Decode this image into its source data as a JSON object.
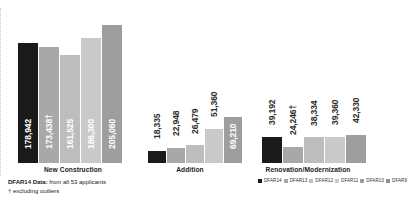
{
  "chart_data": {
    "type": "bar",
    "title": "",
    "xlabel": "",
    "ylabel": "",
    "ylim": [
      0,
      210000
    ],
    "grid": false,
    "legend_position": "bottom-right",
    "categories": [
      "New Construction",
      "Addition",
      "Renovation/Modernization"
    ],
    "series": [
      {
        "name": "DFAR14",
        "color": "#1a1a1a",
        "values": [
          178942,
          18335,
          39192
        ],
        "labels": [
          "178,942",
          "18,335",
          "39,192"
        ]
      },
      {
        "name": "DFAR13",
        "color": "#a8a8a8",
        "values": [
          173438,
          22948,
          24246
        ],
        "labels": [
          "173,438†",
          "22,948",
          "24,246†"
        ]
      },
      {
        "name": "DFAR12",
        "color": "#bdbdbd",
        "values": [
          161525,
          26479,
          38334
        ],
        "labels": [
          "161,525",
          "26,479",
          "38,334"
        ]
      },
      {
        "name": "DFAR11",
        "color": "#c9c9c9",
        "values": [
          186300,
          51360,
          39360
        ],
        "labels": [
          "186,300",
          "51,360",
          "39,360"
        ]
      },
      {
        "name": "DFAR10",
        "color": "#9e9e9e",
        "values": [
          205060,
          69210,
          42330
        ],
        "labels": [
          "205,060",
          "69,210",
          "42,330"
        ]
      }
    ],
    "annotations": {
      "footnote_bold": "DFAR14 Data:",
      "footnote_rest": " from all 53 applicants",
      "footnote_line2": "† excluding outliers"
    }
  },
  "legend": {
    "entries": [
      {
        "label": "DFAR14",
        "color": "#1a1a1a"
      },
      {
        "label": "DFAR13",
        "color": "#a8a8a8"
      },
      {
        "label": "DFAR12",
        "color": "#bdbdbd"
      },
      {
        "label": "DFAR11",
        "color": "#c9c9c9"
      },
      {
        "label": "DFAR10",
        "color": "#9e9e9e"
      },
      {
        "label": "DFAR9",
        "color": "#8f8f8f"
      }
    ]
  },
  "layout": {
    "groups": [
      {
        "left": 18,
        "bar_width": 20,
        "cat_left": 8,
        "cat_width": 130
      },
      {
        "left": 148,
        "bar_width": 18,
        "cat_left": 140,
        "cat_width": 100
      },
      {
        "left": 262,
        "bar_width": 20,
        "cat_left": 248,
        "cat_width": 120
      }
    ],
    "divider_x": 243,
    "baseline_y": 163,
    "max_bar_px": 141
  }
}
